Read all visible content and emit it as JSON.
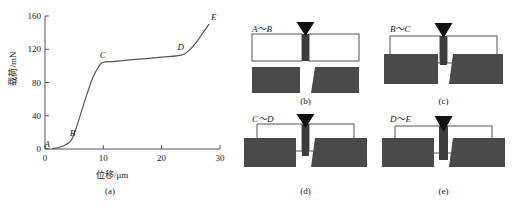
{
  "figure": {
    "panels": [
      {
        "id": "a",
        "caption": "(a)"
      },
      {
        "id": "b",
        "caption": "(b)",
        "stage": "A～B"
      },
      {
        "id": "c",
        "caption": "(c)",
        "stage": "B～C"
      },
      {
        "id": "d",
        "caption": "(d)",
        "stage": "C～D"
      },
      {
        "id": "e",
        "caption": "(e)",
        "stage": "D～E"
      }
    ]
  },
  "chart_data": {
    "type": "line",
    "title": "",
    "xlabel": "位移/μm",
    "ylabel": "载荷/mN",
    "xlim": [
      0,
      30
    ],
    "ylim": [
      0,
      160
    ],
    "xticks": [
      0,
      10,
      20,
      30
    ],
    "yticks": [
      0,
      40,
      80,
      120,
      160
    ],
    "xtick_labels": [
      "0",
      "10",
      "20",
      "30"
    ],
    "ytick_labels": [
      "0",
      "40",
      "80",
      "120",
      "160"
    ],
    "grid": false,
    "legend": false,
    "series": [
      {
        "name": "载荷-位移曲线",
        "x": [
          1.3,
          2.2,
          3.2,
          4.4,
          5.2,
          6.2,
          7.2,
          8.2,
          9.2,
          9.9,
          12.0,
          16.0,
          20.0,
          23.4,
          24.6,
          25.8,
          27.0,
          28.1
        ],
        "y": [
          0.5,
          1.5,
          4.0,
          9.5,
          22.0,
          44.0,
          66.0,
          86.0,
          99.0,
          104.0,
          105.5,
          108.0,
          110.5,
          113.0,
          118.0,
          127.0,
          139.0,
          150.0
        ]
      }
    ],
    "annotations": [
      {
        "label": "A",
        "x": 1.3,
        "y": 0.5,
        "style": "italic"
      },
      {
        "label": "B",
        "x": 4.4,
        "y": 9.5,
        "style": "italic"
      },
      {
        "label": "C",
        "x": 9.9,
        "y": 104.0,
        "style": "italic"
      },
      {
        "label": "D",
        "x": 23.4,
        "y": 113.0,
        "style": "italic"
      },
      {
        "label": "E",
        "x": 28.1,
        "y": 150.0,
        "style": "italic"
      }
    ]
  },
  "schematics": {
    "b": {
      "stage": "A～B",
      "caption": "(b)",
      "description": "indenter-touching-film"
    },
    "c": {
      "stage": "B～C",
      "caption": "(c)",
      "description": "film-deflecting"
    },
    "d": {
      "stage": "C～D",
      "caption": "(d)",
      "description": "film-contacting-substrate"
    },
    "e": {
      "stage": "D～E",
      "caption": "(e)",
      "description": "indenter-penetrating"
    }
  },
  "colors": {
    "substrate": "#4a4a4a",
    "column": "#3d3d3d",
    "indenter": "#111111",
    "film": "#ffffff",
    "outline": "#555555",
    "curve": "#555555"
  }
}
